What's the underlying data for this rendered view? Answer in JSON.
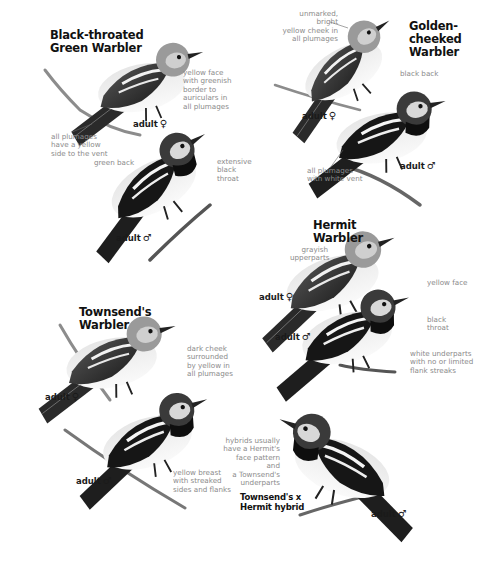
{
  "species": [
    {
      "name": "Black-throated Green Warbler",
      "title_lines": [
        "Black-throated",
        "Green Warbler"
      ],
      "figures": [
        {
          "age_label": "adult",
          "sex_symbol": "♀",
          "notes": [
            "yellow face\nwith greenish\nborder to\nauriculars in\nall plumages",
            "all plumages\nhave a yellow\nside to the vent"
          ]
        },
        {
          "age_label": "adult",
          "sex_symbol": "♂",
          "notes": [
            "green back",
            "extensive\nblack\nthroat"
          ]
        }
      ]
    },
    {
      "name": "Golden-cheeked Warbler",
      "title_lines": [
        "Golden-",
        "cheeked",
        "Warbler"
      ],
      "figures": [
        {
          "age_label": "adult",
          "sex_symbol": "♀",
          "notes": [
            "unmarked, bright\nyellow cheek in\nall plumages"
          ]
        },
        {
          "age_label": "adult",
          "sex_symbol": "♂",
          "notes": [
            "black back",
            "all plumages\nwith white vent"
          ]
        }
      ]
    },
    {
      "name": "Hermit Warbler",
      "title_lines": [
        "Hermit",
        "Warbler"
      ],
      "figures": [
        {
          "age_label": "adult",
          "sex_symbol": "♀",
          "notes": [
            "grayish\nupperparts"
          ]
        },
        {
          "age_label": "adult",
          "sex_symbol": "♂",
          "notes": [
            "yellow face",
            "black\nthroat",
            "white underparts\nwith no or limited\nflank streaks"
          ]
        }
      ]
    },
    {
      "name": "Townsend's Warbler",
      "title_lines": [
        "Townsend's",
        "Warbler"
      ],
      "figures": [
        {
          "age_label": "adult",
          "sex_symbol": "♀",
          "notes": [
            "dark cheek\nsurrounded\nby yellow in\nall plumages"
          ]
        },
        {
          "age_label": "adult",
          "sex_symbol": "♂",
          "notes": [
            "yellow breast\nwith streaked\nsides and flanks"
          ]
        }
      ]
    },
    {
      "name": "Townsend's x Hermit hybrid",
      "title_lines": [
        "Townsend's x",
        "Hermit hybrid"
      ],
      "figures": [
        {
          "age_label": "adult",
          "sex_symbol": "♂",
          "notes": [
            "hybrids usually\nhave a Hermit's\nface pattern and\na Townsend's\nunderparts"
          ]
        }
      ]
    }
  ],
  "colors": {
    "title_text": "#111111",
    "note_text": "#8a8a8a",
    "background": "#ffffff"
  }
}
